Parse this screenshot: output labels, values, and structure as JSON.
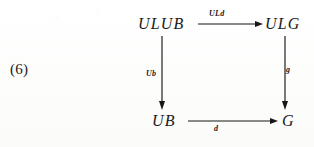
{
  "figure": {
    "kind": "commutative-diagram",
    "equation_number": "(6)",
    "nodes": {
      "top_left": "ULUB",
      "top_right": "ULG",
      "bottom_left": "UB",
      "bottom_right": "G"
    },
    "arrows": {
      "top": {
        "label": "ULd",
        "from": "ULUB",
        "to": "ULG",
        "direction": "right"
      },
      "left": {
        "label": "Ub",
        "from": "ULUB",
        "to": "UB",
        "direction": "down"
      },
      "right": {
        "label": "g",
        "from": "ULG",
        "to": "G",
        "direction": "down"
      },
      "bottom": {
        "label": "d",
        "from": "UB",
        "to": "G",
        "direction": "right"
      }
    },
    "colors": {
      "ink": "#171717",
      "paper": "#fefefe"
    }
  }
}
